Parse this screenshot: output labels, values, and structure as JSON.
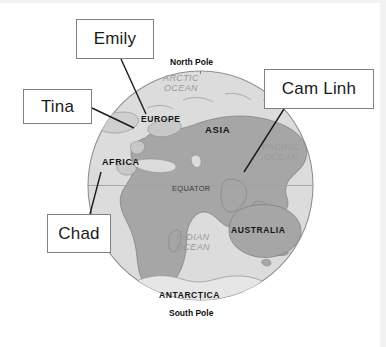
{
  "image": {
    "kind": "labelled-world-globe-diagram",
    "width": 386,
    "height": 347,
    "background_color": "#ffffff"
  },
  "globe": {
    "ocean_color": "#dcdcdc",
    "land_color": "#a8a8a8",
    "outline_color": "#8c8c8c",
    "center_x": 200,
    "center_y": 185,
    "radius": 113
  },
  "map_labels": {
    "north_pole": "North Pole",
    "arctic_ocean_line1": "ARCTIC",
    "arctic_ocean_line2": "OCEAN",
    "europe": "EUROPE",
    "asia": "ASIA",
    "africa": "AFRICA",
    "pacific_ocean_line1": "PACIFIC",
    "pacific_ocean_line2": "OCEAN",
    "equator": "EQUATOR",
    "indian_ocean_line1": "INDIAN",
    "indian_ocean_line2": "OCEAN",
    "australia": "AUSTRALIA",
    "antarctica": "ANTARCTICA",
    "south_pole": "South Pole"
  },
  "callouts": [
    {
      "id": "emily",
      "label": "Emily",
      "box": {
        "x": 76,
        "y": 19,
        "width": 78,
        "height": 40
      },
      "leader_line": {
        "from_x": 121,
        "from_y": 59,
        "to_x": 146,
        "to_y": 114
      },
      "points_to": "EUROPE"
    },
    {
      "id": "tina",
      "label": "Tina",
      "box": {
        "x": 23,
        "y": 89,
        "width": 69,
        "height": 35
      },
      "leader_line": {
        "from_x": 92,
        "from_y": 108,
        "to_x": 134,
        "to_y": 128
      },
      "points_to": "western-europe-coast"
    },
    {
      "id": "cam-linh",
      "label": "Cam Linh",
      "box": {
        "x": 264,
        "y": 69,
        "width": 110,
        "height": 40
      },
      "leader_line": {
        "from_x": 284,
        "from_y": 109,
        "to_x": 244,
        "to_y": 172
      },
      "points_to": "southeast-asia"
    },
    {
      "id": "chad",
      "label": "Chad",
      "box": {
        "x": 47,
        "y": 214,
        "width": 64,
        "height": 39
      },
      "leader_line": {
        "from_x": 90,
        "from_y": 214,
        "to_x": 101,
        "to_y": 172
      },
      "points_to": "AFRICA"
    }
  ]
}
